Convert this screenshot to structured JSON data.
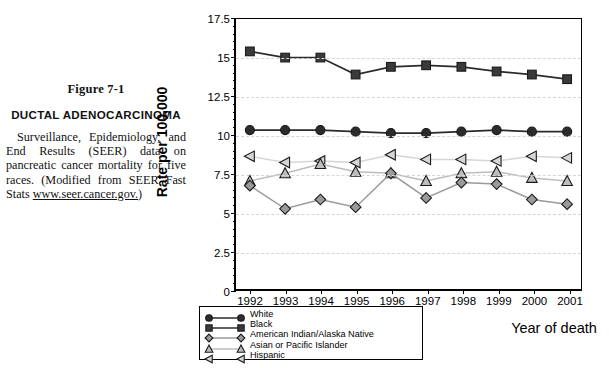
{
  "caption": {
    "figure_number": "Figure 7-1",
    "title": "DUCTAL  ADENOCARCINOMA",
    "body_before_link": "Surveillance, Epidemiology, and End Results (SEER) data on pancreatic cancer mortality for five races. (Modified from SEER Fast Stats ",
    "link": "www.seer.cancer.gov.",
    "body_after_link": ")"
  },
  "chart_data": {
    "type": "line",
    "title": "",
    "xlabel": "Year of death",
    "ylabel": "Rate per 100,000",
    "x": [
      "1992",
      "1993",
      "1994",
      "1995",
      "1996",
      "1997",
      "1998",
      "1999",
      "2000",
      "2001"
    ],
    "ylim": [
      0,
      17.5
    ],
    "yticks": [
      "0",
      "2.5",
      "5",
      "7.5",
      "10",
      "12.5",
      "15",
      "17.5"
    ],
    "ytick_values": [
      0,
      2.5,
      5,
      7.5,
      10,
      12.5,
      15,
      17.5
    ],
    "grid": "horizontal-dashed",
    "legend_position": "below-left",
    "series": [
      {
        "name": "White",
        "marker": "circle",
        "color": "#2b2b2b",
        "values": [
          10.3,
          10.3,
          10.3,
          10.2,
          10.1,
          10.1,
          10.2,
          10.3,
          10.2,
          10.2
        ]
      },
      {
        "name": "Black",
        "marker": "square",
        "color": "#3a3a3a",
        "values": [
          15.4,
          15.0,
          15.0,
          13.9,
          14.4,
          14.5,
          14.4,
          14.1,
          13.9,
          13.6
        ]
      },
      {
        "name": "American Indian/Alaska Native",
        "marker": "diamond",
        "color": "#9a9a9a",
        "values": [
          6.7,
          5.2,
          5.8,
          5.3,
          7.5,
          5.9,
          6.9,
          6.8,
          5.8,
          5.5
        ]
      },
      {
        "name": "Asian or Pacific Islander",
        "marker": "triangle",
        "color": "#bdbdbd",
        "values": [
          7.0,
          7.5,
          8.1,
          7.6,
          7.5,
          7.0,
          7.5,
          7.6,
          7.2,
          7.0
        ]
      },
      {
        "name": "Hispanic",
        "marker": "left-triangle",
        "color": "#d6d6d6",
        "values": [
          8.6,
          8.2,
          8.3,
          8.2,
          8.7,
          8.4,
          8.4,
          8.3,
          8.6,
          8.5
        ]
      }
    ]
  }
}
